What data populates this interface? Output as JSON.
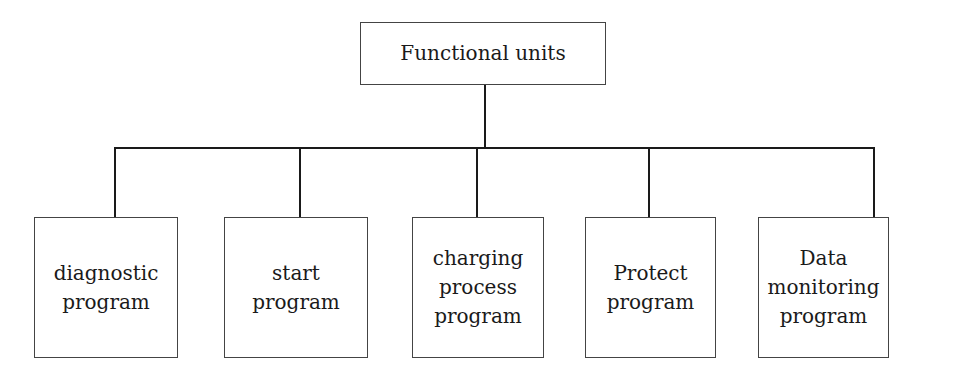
{
  "diagram": {
    "type": "hierarchy-tree",
    "root": {
      "label": "Functional units"
    },
    "children": [
      {
        "label": "diagnostic\nprogram"
      },
      {
        "label": "start\nprogram"
      },
      {
        "label": "charging\nprocess\nprogram"
      },
      {
        "label": "Protect\nprogram"
      },
      {
        "label": "Data\nmonitoring\nprogram"
      }
    ],
    "colors": {
      "line": "#1a1a1a",
      "box_border": "#444444",
      "background": "#ffffff"
    }
  }
}
